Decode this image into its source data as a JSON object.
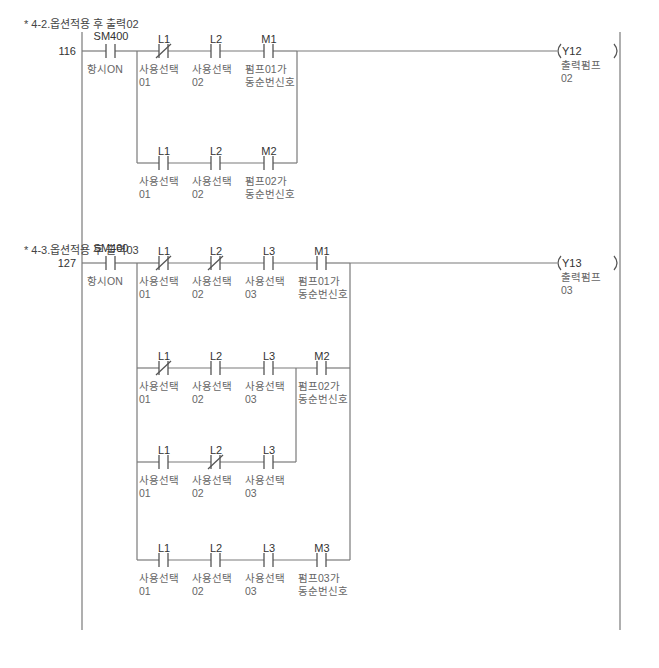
{
  "rungs": [
    {
      "title": "* 4-2.옵션적용 후 출력02",
      "step": "116",
      "enable": {
        "device": "SM400",
        "comment": "항시ON",
        "type": "NO"
      },
      "branches": [
        [
          {
            "device": "L1",
            "comment": "사용선택 01",
            "type": "NC"
          },
          {
            "device": "L2",
            "comment": "사용선택 02",
            "type": "NO"
          },
          {
            "device": "M1",
            "comment": "펌프01가 동순번신호",
            "type": "NO"
          }
        ],
        [
          {
            "device": "L1",
            "comment": "사용선택 01",
            "type": "NO"
          },
          {
            "device": "L2",
            "comment": "사용선택 02",
            "type": "NO"
          },
          {
            "device": "M2",
            "comment": "펌프02가 동순번신호",
            "type": "NO"
          }
        ]
      ],
      "coil": {
        "device": "Y12",
        "comment": "출력펌프 02"
      }
    },
    {
      "title": "* 4-3.옵션적용 후 출력03",
      "step": "127",
      "enable": {
        "device": "SM400",
        "comment": "항시ON",
        "type": "NO"
      },
      "branches": [
        [
          {
            "device": "L1",
            "comment": "사용선택 01",
            "type": "NC"
          },
          {
            "device": "L2",
            "comment": "사용선택 02",
            "type": "NC"
          },
          {
            "device": "L3",
            "comment": "사용선택 03",
            "type": "NO"
          },
          {
            "device": "M1",
            "comment": "펌프01가 동순번신호",
            "type": "NO"
          }
        ],
        [
          {
            "device": "L1",
            "comment": "사용선택 01",
            "type": "NC"
          },
          {
            "device": "L2",
            "comment": "사용선택 02",
            "type": "NO"
          },
          {
            "device": "L3",
            "comment": "사용선택 03",
            "type": "NO"
          },
          {
            "device": "M2",
            "comment": "펌프02가 동순번신호",
            "type": "NO"
          }
        ],
        [
          {
            "device": "L1",
            "comment": "사용선택 01",
            "type": "NO"
          },
          {
            "device": "L2",
            "comment": "사용선택 02",
            "type": "NC"
          },
          {
            "device": "L3",
            "comment": "사용선택 03",
            "type": "NO"
          }
        ],
        [
          {
            "device": "L1",
            "comment": "사용선택 01",
            "type": "NO"
          },
          {
            "device": "L2",
            "comment": "사용선택 02",
            "type": "NO"
          },
          {
            "device": "L3",
            "comment": "사용선택 03",
            "type": "NO"
          },
          {
            "device": "M3",
            "comment": "펌프03가 동순번신호",
            "type": "NO"
          }
        ]
      ],
      "coil": {
        "device": "Y13",
        "comment": "출력펌프 03"
      }
    }
  ],
  "colors": {
    "line": "#7a7a7a",
    "text": "#444444",
    "background": "#ffffff"
  }
}
